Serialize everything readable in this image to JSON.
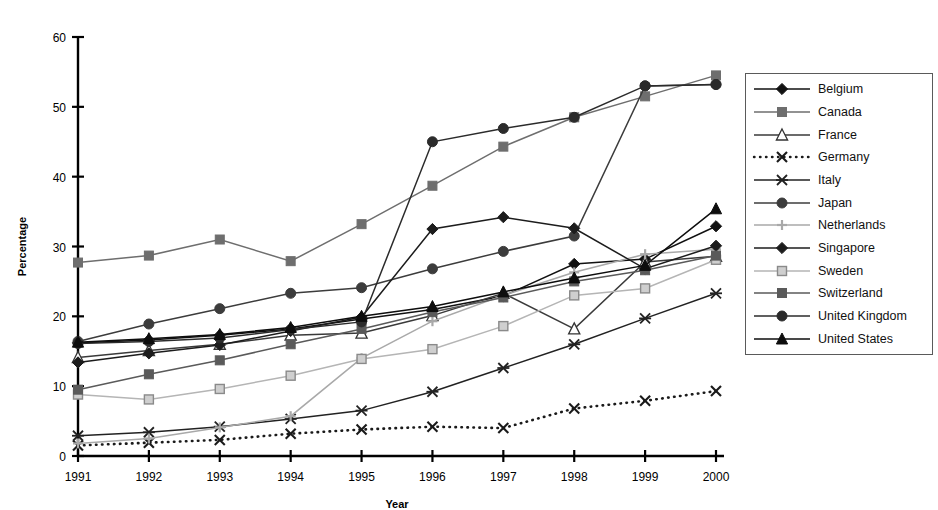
{
  "chart_data": {
    "type": "line",
    "title": "",
    "xlabel": "Year",
    "ylabel": "Percentage",
    "x": [
      1991,
      1992,
      1993,
      1994,
      1995,
      1996,
      1997,
      1998,
      1999,
      2000
    ],
    "xtick_labels": [
      "1991",
      "1992",
      "1993",
      "1994",
      "1995",
      "1996",
      "1997",
      "1998",
      "1999",
      "2000"
    ],
    "ytick_labels": [
      "0",
      "10",
      "20",
      "30",
      "40",
      "50",
      "60"
    ],
    "ylim": [
      0,
      60
    ],
    "ytick_step": 10,
    "grid": false,
    "legend_position": "right-outside",
    "series": [
      {
        "name": "Belgium",
        "marker": "diamond-filled",
        "color": "#111111",
        "line_style": "solid",
        "values": [
          16.2,
          16.6,
          17.3,
          18.2,
          19.6,
          21.0,
          22.9,
          27.5,
          28.2,
          32.9
        ]
      },
      {
        "name": "Canada",
        "marker": "square-filled",
        "color": "#6e6e6e",
        "line_style": "solid",
        "values": [
          27.7,
          28.7,
          31.0,
          27.9,
          33.2,
          38.7,
          44.3,
          48.5,
          51.5,
          54.5
        ]
      },
      {
        "name": "France",
        "marker": "triangle-open",
        "color": "#3a3a3a",
        "line_style": "solid",
        "values": [
          14.1,
          15.1,
          16.0,
          17.3,
          17.6,
          20.1,
          23.3,
          18.2,
          27.8,
          28.6
        ]
      },
      {
        "name": "Germany",
        "marker": "cross-x",
        "color": "#1a1a1a",
        "line_style": "dotted",
        "values": [
          1.5,
          1.9,
          2.3,
          3.2,
          3.8,
          4.2,
          4.0,
          6.8,
          7.9,
          9.3
        ]
      },
      {
        "name": "Italy",
        "marker": "asterisk",
        "color": "#222222",
        "line_style": "solid",
        "values": [
          2.9,
          3.4,
          4.2,
          5.3,
          6.5,
          9.2,
          12.6,
          16.0,
          19.7,
          23.3
        ]
      },
      {
        "name": "Japan",
        "marker": "circle-filled",
        "color": "#3c3c3c",
        "line_style": "solid",
        "values": [
          16.4,
          18.9,
          21.1,
          23.3,
          24.1,
          26.8,
          29.3,
          31.5,
          53.0,
          53.2
        ]
      },
      {
        "name": "Netherlands",
        "marker": "plus",
        "color": "#a9a9a9",
        "line_style": "solid",
        "values": [
          1.8,
          2.5,
          4.1,
          5.7,
          14.0,
          19.3,
          23.0,
          26.3,
          28.9,
          29.6
        ]
      },
      {
        "name": "Singapore",
        "marker": "diamond-filled",
        "color": "#1c1c1c",
        "line_style": "solid",
        "values": [
          13.4,
          14.7,
          15.9,
          17.9,
          19.9,
          32.5,
          34.2,
          32.6,
          26.8,
          30.1
        ]
      },
      {
        "name": "Sweden",
        "marker": "square-open",
        "color": "#b5b5b5",
        "line_style": "solid",
        "values": [
          8.8,
          8.1,
          9.6,
          11.5,
          13.9,
          15.3,
          18.6,
          23.0,
          24.0,
          28.1
        ]
      },
      {
        "name": "Switzerland",
        "marker": "square-filled",
        "color": "#5a5a5a",
        "line_style": "solid",
        "values": [
          9.5,
          11.7,
          13.7,
          16.0,
          18.2,
          20.6,
          22.7,
          25.0,
          26.6,
          28.7
        ]
      },
      {
        "name": "United Kingdom",
        "marker": "circle-filled",
        "color": "#2b2b2b",
        "line_style": "solid",
        "values": [
          16.1,
          16.4,
          16.9,
          18.1,
          19.2,
          45.0,
          46.9,
          48.5,
          53.0,
          53.2
        ]
      },
      {
        "name": "United States",
        "marker": "triangle-filled",
        "color": "#0d0d0d",
        "line_style": "solid",
        "values": [
          16.3,
          16.8,
          17.4,
          18.4,
          20.0,
          21.4,
          23.5,
          25.5,
          27.3,
          35.4
        ]
      }
    ]
  },
  "legend": {
    "items": [
      {
        "label": "Belgium"
      },
      {
        "label": "Canada"
      },
      {
        "label": "France"
      },
      {
        "label": "Germany"
      },
      {
        "label": "Italy"
      },
      {
        "label": "Japan"
      },
      {
        "label": "Netherlands"
      },
      {
        "label": "Singapore"
      },
      {
        "label": "Sweden"
      },
      {
        "label": "Switzerland"
      },
      {
        "label": "United Kingdom"
      },
      {
        "label": "United States"
      }
    ]
  }
}
